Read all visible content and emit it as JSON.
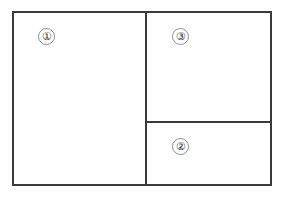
{
  "diagram": {
    "type": "page-layout-region-diagram",
    "frame": {
      "border_color": "#3a3a3a",
      "fill_color": "#ffffff"
    },
    "badge_outline_color": "#8d8d8d",
    "regions": [
      {
        "id": "region-1",
        "label": "①",
        "number": "1",
        "position": "left-column"
      },
      {
        "id": "region-3",
        "label": "③",
        "number": "3",
        "position": "right-column-top"
      },
      {
        "id": "region-2",
        "label": "②",
        "number": "2",
        "position": "right-column-bottom"
      }
    ]
  }
}
